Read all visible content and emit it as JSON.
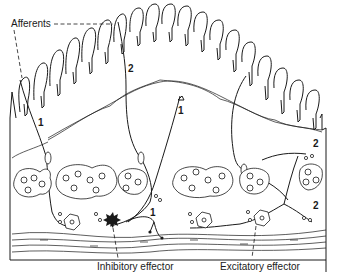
{
  "diagram": {
    "labels": {
      "afferents": "Afferents",
      "inhibitory_effector": "Inhibitory effector",
      "excitatory_effector": "Excitatory effector"
    },
    "neuron_numbers": [
      {
        "id": "n1_left",
        "text": "1"
      },
      {
        "id": "n2_top",
        "text": "2"
      },
      {
        "id": "n1_mid",
        "text": "1"
      },
      {
        "id": "n2_right_top",
        "text": "2"
      },
      {
        "id": "n1_bottom",
        "text": "1"
      },
      {
        "id": "n2_right_bottom",
        "text": "2"
      }
    ],
    "colors": {
      "line": "#1a1a1a",
      "background": "#ffffff"
    }
  }
}
